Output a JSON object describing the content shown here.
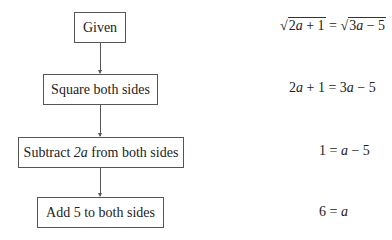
{
  "flowchart": {
    "steps": [
      {
        "label": "Given"
      },
      {
        "label_prefix": "Subtract ",
        "label_var": "2a",
        "label_suffix": " from both sides"
      },
      {
        "label": "Square both sides"
      },
      {
        "label": "Add 5 to both sides"
      }
    ],
    "step_labels": [
      "Given",
      "Square both sides",
      "Subtract 2a from both sides",
      "Add 5 to both sides"
    ]
  },
  "equations": {
    "given": {
      "left_radicand_num": "2",
      "left_radicand_var": "a",
      "left_rest": " + 1",
      "equals": " = ",
      "right_radicand_num": "3",
      "right_radicand_var": "a",
      "right_rest": " − 5",
      "text": "√(2a + 1) = √(3a − 5)"
    },
    "squared": {
      "text": "2a + 1 = 3a − 5",
      "p1": "2",
      "v1": "a",
      "p2": " + 1 = 3",
      "v2": "a",
      "p3": " − 5"
    },
    "subtracted": {
      "text": "1 = a − 5",
      "p1": "1 = ",
      "v1": "a",
      "p2": " − 5"
    },
    "added": {
      "text": "6 = a",
      "p1": "6 = ",
      "v1": "a"
    }
  },
  "labels": {
    "given": "Given",
    "square": "Square both sides",
    "subtract_prefix": "Subtract ",
    "subtract_var": "2a",
    "subtract_suffix": " from both sides",
    "add": "Add 5 to both sides"
  }
}
